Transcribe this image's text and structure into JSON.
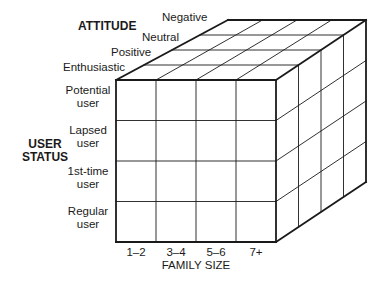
{
  "diagram": {
    "type": "3d-cube-segmentation",
    "axes": {
      "attitude": {
        "title": "ATTITUDE",
        "levels": [
          "Enthusiastic",
          "Positive",
          "Neutral",
          "Negative"
        ]
      },
      "user_status": {
        "title_line1": "USER",
        "title_line2": "STATUS",
        "levels": [
          {
            "line1": "Potential",
            "line2": "user"
          },
          {
            "line1": "Lapsed",
            "line2": "user"
          },
          {
            "line1": "1st-time",
            "line2": "user"
          },
          {
            "line1": "Regular",
            "line2": "user"
          }
        ]
      },
      "family_size": {
        "title": "FAMILY SIZE",
        "levels": [
          "1–2",
          "3–4",
          "5–6",
          "7+"
        ]
      }
    },
    "grid": {
      "rows": 4,
      "cols": 4,
      "depth": 4
    },
    "colors": {
      "line": "#1a1a1a",
      "background": "#ffffff"
    }
  }
}
